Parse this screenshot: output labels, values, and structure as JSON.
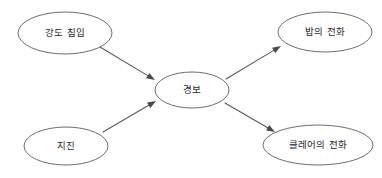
{
  "diagram": {
    "type": "bayesian-network",
    "title": "",
    "background_color": "#ffffff",
    "node_stroke_color": "#6e6e6e",
    "edge_color": "#5a5a5a",
    "label_color": "#2a2a2a",
    "nodes": [
      {
        "id": "burglary",
        "label": "강도 침입",
        "cx": 65,
        "cy": 33,
        "rx": 47,
        "ry": 21
      },
      {
        "id": "earthquake",
        "label": "지진",
        "cx": 66,
        "cy": 146,
        "rx": 42,
        "ry": 19
      },
      {
        "id": "alarm",
        "label": "경보",
        "cx": 192,
        "cy": 90,
        "rx": 37,
        "ry": 18
      },
      {
        "id": "bob-calls",
        "label": "밥의 전화",
        "cx": 325,
        "cy": 32,
        "rx": 47,
        "ry": 20
      },
      {
        "id": "claire-calls",
        "label": "클레어의 전화",
        "cx": 318,
        "cy": 145,
        "rx": 55,
        "ry": 20
      }
    ],
    "edges": [
      {
        "id": "burglary-to-alarm",
        "from": "burglary",
        "to": "alarm",
        "from_label": "강도 침입",
        "to_label": "경보",
        "x1": 100,
        "y1": 47,
        "x2": 155,
        "y2": 80
      },
      {
        "id": "earthquake-to-alarm",
        "from": "earthquake",
        "to": "alarm",
        "from_label": "지진",
        "to_label": "경보",
        "x1": 103,
        "y1": 132,
        "x2": 156,
        "y2": 101
      },
      {
        "id": "alarm-to-bob-calls",
        "from": "alarm",
        "to": "bob-calls",
        "from_label": "경보",
        "to_label": "밥의 전화",
        "x1": 226,
        "y1": 79,
        "x2": 281,
        "y2": 46
      },
      {
        "id": "alarm-to-claire-calls",
        "from": "alarm",
        "to": "claire-calls",
        "from_label": "경보",
        "to_label": "클레어의 전화",
        "x1": 225,
        "y1": 103,
        "x2": 275,
        "y2": 132
      }
    ]
  }
}
